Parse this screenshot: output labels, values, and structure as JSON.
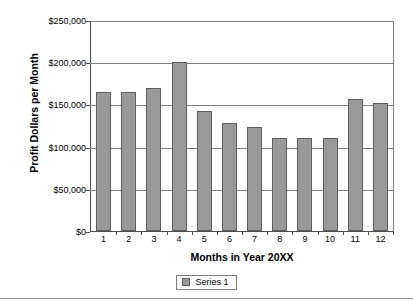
{
  "chart_data": {
    "type": "bar",
    "title": "",
    "xlabel": "Months in Year 20XX",
    "ylabel": "Profit Dollars per Month",
    "categories": [
      "1",
      "2",
      "3",
      "4",
      "5",
      "6",
      "7",
      "8",
      "9",
      "10",
      "11",
      "12"
    ],
    "values": [
      166000,
      166000,
      170000,
      201000,
      143000,
      128000,
      124000,
      111000,
      111000,
      111000,
      157000,
      152000
    ],
    "series": [
      {
        "name": "Series 1",
        "values": [
          166000,
          166000,
          170000,
          201000,
          143000,
          128000,
          124000,
          111000,
          111000,
          111000,
          157000,
          152000
        ]
      }
    ],
    "ylim": [
      0,
      250000
    ],
    "ytick_values": [
      0,
      50000,
      100000,
      150000,
      200000,
      250000
    ],
    "ytick_labels": [
      "$0",
      "$50,000",
      "$100,000",
      "$150,000",
      "$200,000",
      "$250,000"
    ],
    "grid": "horizontal",
    "legend_position": "bottom-center",
    "bar_color": "#989898",
    "bar_edge_color": "#5e5e5e",
    "gridline_color": "#808080",
    "axis_color": "#4d4d4d",
    "background_color": "#ffffff",
    "text_color": "#000000"
  },
  "legend": {
    "entries": [
      {
        "label": "Series 1",
        "swatch_icon": "square-swatch-icon"
      }
    ]
  }
}
